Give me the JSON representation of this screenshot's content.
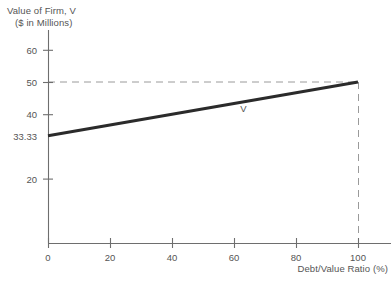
{
  "chart_data": {
    "type": "line",
    "title": "",
    "ylabel": "Value of Firm, V",
    "ylabel_sub": "($ in Millions)",
    "xlabel": "Debt/Value Ratio (%)",
    "xlim": [
      0,
      100
    ],
    "ylim": [
      0,
      65
    ],
    "grid": false,
    "legend": "none",
    "x_ticks": [
      {
        "value": 0,
        "label": "0"
      },
      {
        "value": 20,
        "label": "20"
      },
      {
        "value": 40,
        "label": "40"
      },
      {
        "value": 60,
        "label": "60"
      },
      {
        "value": 80,
        "label": "80"
      },
      {
        "value": 100,
        "label": "100"
      }
    ],
    "y_ticks": [
      {
        "value": 60,
        "label": "60",
        "tick_mark": true
      },
      {
        "value": 50,
        "label": "50",
        "tick_mark": true
      },
      {
        "value": 40,
        "label": "40",
        "tick_mark": true
      },
      {
        "value": 33.33,
        "label": "33.33",
        "tick_mark": false
      },
      {
        "value": 20,
        "label": "20",
        "tick_mark": true
      }
    ],
    "series": [
      {
        "name": "V",
        "label": "V",
        "label_x": 63,
        "label_y": 42,
        "color": "#2b2b2b",
        "x": [
          0,
          100
        ],
        "values": [
          33.33,
          50
        ]
      }
    ],
    "annotations": [
      {
        "name": "reference-line-horizontal",
        "style": "dashed",
        "orientation": "horizontal",
        "value": 50,
        "from": 0,
        "to": 100
      },
      {
        "name": "reference-line-vertical",
        "style": "dashed",
        "orientation": "vertical",
        "value": 100,
        "from": 0,
        "to": 50
      }
    ],
    "colors": {
      "series_line": "#2b2b2b",
      "axis": "#6e6e6e",
      "dashed": "#9a9a9a",
      "text": "#555555",
      "background": "#ffffff"
    }
  }
}
